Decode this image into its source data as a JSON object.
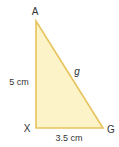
{
  "figure": {
    "type": "right-triangle",
    "colors": {
      "fill": "#fdf3c8",
      "stroke": "#e6c35c",
      "text": "#333333"
    },
    "vertices": [
      {
        "id": "A",
        "label": "A",
        "x": 36,
        "y": 21
      },
      {
        "id": "X",
        "label": "X",
        "x": 36,
        "y": 128
      },
      {
        "id": "G",
        "label": "G",
        "x": 103,
        "y": 128
      }
    ],
    "sides": {
      "AX": {
        "label": "5 cm"
      },
      "XG": {
        "label": "3.5 cm"
      },
      "AG": {
        "label": "g"
      }
    }
  }
}
